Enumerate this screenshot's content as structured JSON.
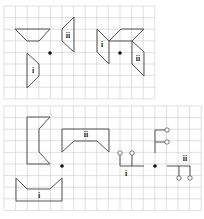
{
  "panels": [
    {
      "id": "top",
      "grid": {
        "x0": 4,
        "y0": 6,
        "cols": 13,
        "rows": 8,
        "cell": 11.6
      },
      "centre_dots": [
        {
          "x": 50,
          "y": 53
        },
        {
          "x": 120,
          "y": 53
        }
      ],
      "figures": [
        {
          "name": "object-trapezoid",
          "points": "15,29 50,29 39,41 27,41",
          "closed": true,
          "label": ""
        },
        {
          "name": "image-ii-left",
          "points": "74,17 74,52 62,41 62,29",
          "closed": true,
          "label": "ii",
          "label_pos": [
            68,
            38
          ]
        },
        {
          "name": "image-i-left",
          "points": "27,53 39,64 39,76 27,88",
          "closed": true,
          "label": "i",
          "label_pos": [
            33,
            73
          ]
        },
        {
          "name": "image-i-right",
          "points": "97,29 109,41 109,64 97,52",
          "closed": true,
          "label": "i",
          "label_pos": [
            102,
            47
          ]
        },
        {
          "name": "object-wing-right",
          "points": "109,41 121,29 144,29 132,41",
          "closed": true,
          "label": ""
        },
        {
          "name": "image-ii-right",
          "points": "132,41 144,52 144,76 132,64",
          "closed": true,
          "label": "ii",
          "label_pos": [
            138,
            61
          ]
        }
      ]
    },
    {
      "id": "bottom",
      "grid": {
        "x0": 4,
        "y0": 106,
        "cols": 17,
        "rows": 9,
        "cell": 11.6
      },
      "centre_dots": [
        {
          "x": 62,
          "y": 166
        },
        {
          "x": 155,
          "y": 166
        }
      ],
      "figures": [
        {
          "name": "object-bracket",
          "points": "27,117 50,117 39,129 39,152 50,164 27,164",
          "closed": true,
          "label": ""
        },
        {
          "name": "image-ii-bracket",
          "points": "62,129 109,129 109,152 97,141 74,141 62,152",
          "closed": true,
          "label": "ii",
          "label_pos": [
            86,
            137
          ]
        },
        {
          "name": "image-i-bracket",
          "points": "16,178 27,189 50,189 62,178 62,201 16,201",
          "closed": true,
          "label": "i",
          "label_pos": [
            39,
            198
          ]
        }
      ],
      "stem_figures": [
        {
          "name": "image-i-stems",
          "path": "M120,153 L120,166 L144,166 M132,166 L132,155",
          "rings": [
            [
              120,
              153
            ],
            [
              132,
              153
            ]
          ],
          "label": "i",
          "label_pos": [
            126,
            176
          ]
        },
        {
          "name": "object-stems",
          "path": "M155,153 L155,130 L167,130 M155,142 L167,142",
          "rings": [
            [
              167,
              130
            ],
            [
              167,
              142
            ]
          ],
          "label": ""
        },
        {
          "name": "image-ii-stems",
          "path": "M167,166 L190,166 L190,178 M179,166 L179,178",
          "rings": [
            [
              179,
              178
            ],
            [
              190,
              178
            ]
          ],
          "label": "ii",
          "label_pos": [
            185,
            161
          ]
        }
      ]
    }
  ],
  "labels": {
    "i": "i",
    "ii": "ii"
  }
}
